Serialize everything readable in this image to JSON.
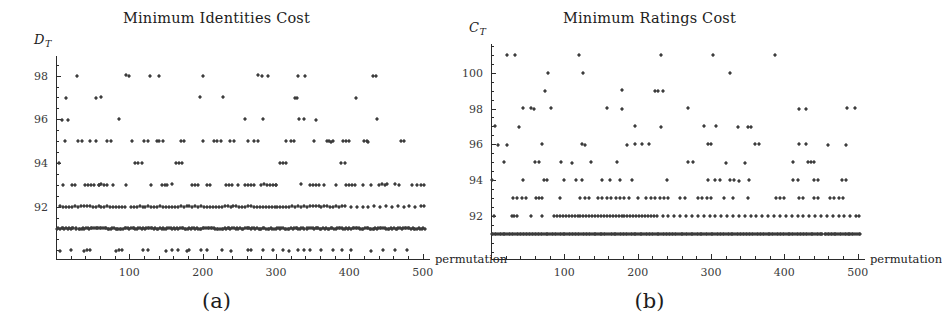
{
  "figure": {
    "panels": [
      {
        "letter": "(a)",
        "title": "Minimum Identities Cost",
        "ylabel_main": "D",
        "ylabel_sub": "T",
        "xlabel": "permutation"
      },
      {
        "letter": "(b)",
        "title": "Minimum Ratings Cost",
        "ylabel_main": "C",
        "ylabel_sub": "T",
        "xlabel": "permutation"
      }
    ]
  },
  "chart_data": [
    {
      "type": "scatter",
      "title": "Minimum Identities Cost",
      "panel": "(a)",
      "xlabel": "permutation",
      "ylabel": "D_T",
      "xlim": [
        0,
        510
      ],
      "ylim": [
        89.6,
        98.9
      ],
      "xticks": [
        100,
        200,
        300,
        400,
        500
      ],
      "xtick_labels": [
        "100",
        "200",
        "300",
        "400",
        "500"
      ],
      "x_minor_step": 20,
      "yticks": [
        92,
        94,
        96,
        98
      ],
      "ytick_labels": [
        "92",
        "94",
        "96",
        "98"
      ],
      "y_minor_step": 0.5,
      "grid": false,
      "legend": false,
      "marker": "diamond",
      "marker_color": "#3c3c3c",
      "level_counts": {
        "90": 34,
        "91": 196,
        "93": 62,
        "92": 110,
        "94": 12,
        "95": 40,
        "96": 9,
        "97": 8,
        "98": 13
      },
      "levels": [
        {
          "y": 98,
          "x": [
            28,
            95,
            99,
            128,
            141,
            200,
            276,
            281,
            289,
            330,
            340,
            432,
            436
          ]
        },
        {
          "y": 97,
          "x": [
            14,
            55,
            62,
            197,
            228,
            326,
            329,
            409
          ]
        },
        {
          "y": 96,
          "x": [
            8,
            16,
            86,
            258,
            282,
            331,
            338,
            355,
            438
          ]
        },
        {
          "y": 95,
          "x": [
            12,
            46,
            55,
            104,
            138,
            141,
            146,
            201,
            215,
            237,
            243,
            262,
            314,
            352,
            372,
            378,
            392,
            396,
            400,
            424,
            30,
            70,
            120,
            170,
            220,
            270,
            320,
            370,
            420,
            470,
            35,
            75,
            125,
            175,
            225,
            275,
            325,
            375,
            425,
            475
          ]
        },
        {
          "y": 94,
          "x": [
            4,
            108,
            112,
            117,
            163,
            168,
            172,
            306,
            309,
            313,
            389,
            394
          ]
        },
        {
          "y": 93,
          "x": [
            40,
            44,
            48,
            52,
            58,
            62,
            66,
            70,
            145,
            149,
            186,
            190,
            194,
            232,
            236,
            240,
            258,
            262,
            266,
            270,
            280,
            284,
            288,
            292,
            300,
            346,
            350,
            354,
            396,
            400,
            404,
            408,
            440,
            444,
            448,
            452,
            22,
            26,
            78,
            130,
            158,
            210,
            300,
            334,
            366,
            418,
            462,
            486,
            10,
            96,
            152,
            206,
            248,
            296,
            358,
            382,
            430,
            468,
            492,
            498,
            502,
            58
          ]
        },
        {
          "y": 92,
          "x": [
            6,
            10,
            14,
            18,
            26,
            30,
            34,
            38,
            46,
            54,
            62,
            70,
            78,
            86,
            94,
            102,
            106,
            110,
            114,
            118,
            122,
            126,
            130,
            134,
            138,
            142,
            146,
            150,
            154,
            158,
            162,
            166,
            170,
            174,
            178,
            182,
            186,
            190,
            194,
            198,
            202,
            206,
            210,
            214,
            218,
            222,
            226,
            230,
            234,
            238,
            242,
            246,
            250,
            258,
            266,
            274,
            282,
            290,
            298,
            306,
            314,
            322,
            330,
            338,
            346,
            354,
            362,
            370,
            378,
            386,
            394,
            402,
            410,
            418,
            426,
            434,
            442,
            450,
            458,
            466,
            474,
            482,
            490,
            498,
            502,
            90,
            82,
            74,
            66,
            58,
            50,
            42,
            22,
            254,
            262,
            270,
            278,
            286,
            294,
            302,
            310,
            318,
            326,
            334,
            342,
            350,
            358,
            366,
            374,
            382,
            390
          ]
        },
        {
          "y": 91,
          "x": "dense_band_0_to_505"
        },
        {
          "y": 90,
          "x": [
            6,
            20,
            38,
            42,
            46,
            82,
            86,
            90,
            118,
            126,
            150,
            158,
            166,
            178,
            182,
            198,
            206,
            226,
            238,
            262,
            266,
            282,
            296,
            310,
            318,
            330,
            338,
            346,
            362,
            378,
            390,
            402,
            430,
            446,
            462,
            478
          ]
        }
      ]
    },
    {
      "type": "scatter",
      "title": "Minimum Ratings Cost",
      "panel": "(b)",
      "xlabel": "permutation",
      "ylabel": "C_T",
      "xlim": [
        0,
        510
      ],
      "ylim": [
        89.6,
        101.6
      ],
      "xticks": [
        100,
        200,
        300,
        400,
        500
      ],
      "xtick_labels": [
        "100",
        "200",
        "300",
        "400",
        "500"
      ],
      "x_minor_step": 20,
      "yticks": [
        92,
        94,
        96,
        98,
        100
      ],
      "ytick_labels": [
        "92",
        "94",
        "96",
        "98",
        "100"
      ],
      "y_minor_step": 0.5,
      "grid": false,
      "legend": false,
      "marker": "diamond",
      "marker_color": "#3c3c3c",
      "level_counts": {
        "90": 2,
        "91": 210,
        "92": 118,
        "93": 72,
        "94": 44,
        "95": 24,
        "96": 26,
        "97": 12,
        "98": 11,
        "99": 7,
        "100": 3,
        "101": 6
      },
      "levels": [
        {
          "y": 101,
          "x": [
            22,
            33,
            120,
            232,
            303,
            387
          ]
        },
        {
          "y": 100,
          "x": [
            78,
            126,
            326
          ]
        },
        {
          "y": 99,
          "x": [
            74,
            178,
            224,
            228,
            234
          ]
        },
        {
          "y": 98,
          "x": [
            44,
            54,
            58,
            82,
            158,
            178,
            268,
            420,
            430,
            486,
            497
          ]
        },
        {
          "y": 97,
          "x": [
            6,
            38,
            196,
            232,
            290,
            307,
            337,
            351,
            355
          ]
        },
        {
          "y": 96,
          "x": [
            10,
            22,
            70,
            124,
            128,
            186,
            196,
            206,
            216,
            296,
            300,
            360,
            366,
            420,
            430,
            460,
            484
          ]
        },
        {
          "y": 95,
          "x": [
            18,
            60,
            66,
            96,
            110,
            136,
            172,
            268,
            276,
            320,
            346,
            412,
            432,
            436,
            440
          ]
        },
        {
          "y": 94,
          "x": [
            2,
            44,
            72,
            76,
            100,
            116,
            124,
            152,
            162,
            176,
            192,
            240,
            296,
            306,
            312,
            326,
            332,
            338,
            352,
            412,
            418,
            440,
            446,
            478,
            484
          ]
        },
        {
          "y": 93,
          "x": [
            30,
            36,
            42,
            48,
            62,
            66,
            70,
            94,
            122,
            128,
            134,
            146,
            152,
            158,
            164,
            170,
            176,
            182,
            188,
            200,
            212,
            218,
            224,
            230,
            236,
            242,
            258,
            264,
            282,
            288,
            294,
            300,
            318,
            330,
            350,
            388,
            394,
            400,
            420,
            426,
            440,
            446,
            462,
            468,
            474,
            480
          ]
        },
        {
          "y": 92,
          "x": [
            4,
            28,
            32,
            36,
            54,
            70,
            86,
            90,
            94,
            98,
            102,
            106,
            110,
            114,
            118,
            122,
            126,
            130,
            134,
            138,
            142,
            146,
            150,
            154,
            158,
            162,
            166,
            170,
            174,
            178,
            182,
            186,
            190,
            194,
            198,
            202,
            206,
            210,
            214,
            218,
            222,
            226,
            234,
            242,
            250,
            258,
            266,
            274,
            282,
            290,
            298,
            306,
            314,
            322,
            330,
            338,
            346,
            354,
            362,
            370,
            378,
            386,
            394,
            402,
            410,
            418,
            426,
            434,
            442,
            450,
            458,
            466,
            474,
            482,
            490,
            498,
            502
          ]
        },
        {
          "y": 91,
          "x": "dense_band_0_to_505"
        }
      ]
    }
  ]
}
